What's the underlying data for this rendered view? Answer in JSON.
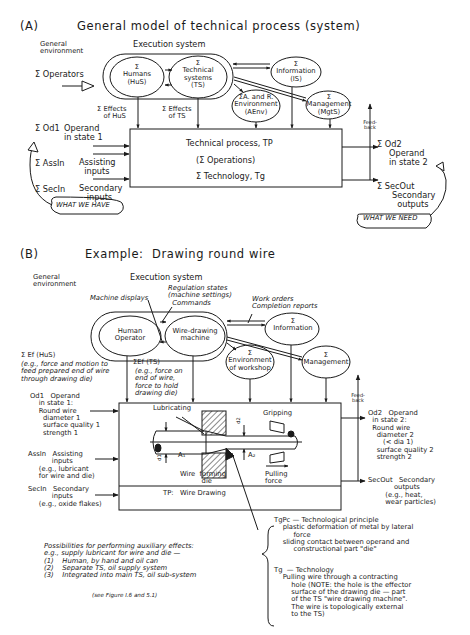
{
  "panelA": {
    "label": "(A)",
    "title": "General model of technical process (system)",
    "general_environment": "General\nenvironment",
    "execution_system": "Execution system",
    "operators": "Σ Operators",
    "humans": "Σ\nHumans\n(HuS)",
    "technical_systems": "Σ\nTechnical\nsystems\n(TS)",
    "information": "Σ\nInformation\n(IS)",
    "environment": "ΣA. and R.\nEnvironment\n(AEnv)",
    "management": "Σ\nManagement\n(MgtS)",
    "effects_hus": "Σ Effects\n   of HuS",
    "effects_ts": "Σ Effects\n   of TS",
    "od1": "Σ Od1",
    "od1_desc": "Operand\nin state 1",
    "assin": "Σ AssIn",
    "assin_desc": "Assisting\n  inputs",
    "secin": "Σ SecIn",
    "secin_desc": "Secondary\n   inputs",
    "process_title": "Technical process, TP",
    "process_ops": "(Σ Operations)",
    "process_tech": "Σ Technology, Tg",
    "feedback": "Feed-\nback",
    "od2": "Σ Od2",
    "od2_desc": "Operand\nin state 2",
    "secout": "Σ SecOut",
    "secout_desc": "Secondary\n  outputs",
    "what_we_have": "WHAT WE HAVE",
    "what_we_need": "WHAT WE NEED"
  },
  "panelB": {
    "label": "(B)",
    "title": "Example:  Drawing round wire",
    "general_environment": "General\nenvironment",
    "execution_system": "Execution system",
    "machine_displays": "Machine displays",
    "regulation": "Regulation states\n(machine settings)\n  Commands",
    "work_orders": "Work orders\nCompletion reports",
    "human_operator": "Human\nOperator",
    "wire_machine": "Wire-drawing\nmachine",
    "information": "Σ\nInformation",
    "environment": "Σ\nEnvironment\nof workshop",
    "management": "Σ\nManagement",
    "ef_hus": "Σ Ef (HuS)",
    "ef_hus_desc": "(e.g., force and motion to\nfeed prepared end of wire\nthrough drawing die)",
    "ef_ts": "ΣEf (TS)",
    "ef_ts_desc": "(e.g., force on\nend of wire,\nforce to hold\ndrawing die)",
    "od1": "Od1   Operand\n    in state 1:\n    Round wire\n      diameter 1\n      surface quality 1\n      strength 1",
    "assin": "AssIn   Assisting\n           inputs\n     (e.g., lubricant\n     for wire and die)",
    "secin": "SecIn   Secondary\n           inputs\n     (e.g., oxide flakes)",
    "lubricating": "Lubricating",
    "gripping": "Gripping",
    "d1": "d1",
    "d2": "d2",
    "a1": "A₁",
    "a2": "A₂",
    "die": "Wire  forming\n          die",
    "pulling": "Pulling\nforce",
    "tp": "TP:   Wire Drawing",
    "feedback": "Feed-\nback",
    "od2": "Od2   Operand\n  in state 2:\n  Round wire\n    diameter 2\n       (< dia 1)\n    surface quality 2\n    strength 2",
    "secout": "SecOut   Secondary\n            outputs\n        (e.g., heat,\n        wear particles)",
    "possibilities": "Possibilities for performing auxiliary effects:\ne.g., supply lubricant for wire and die —\n(1)    Human, by hand and oil can\n(2)    Separate TS, oil supply system\n(3)    Integrated into main TS, oil sub-system",
    "see_figure": "(see Figure I.6 and 5.1)",
    "tgpc": "TgPc — Technological principle\n    plastic deformation of metal by lateral\n         force\n    sliding contact between operand and\n         constructional part \"die\"",
    "tg": "Tg  — Technology\n    Pulling wire through a contracting\n        hole (NOTE: the hole is the effector\n        surface of the drawing die — part\n        of the TS \"wire drawing machine\".\n        The wire is topologically external\n        to the TS)"
  }
}
